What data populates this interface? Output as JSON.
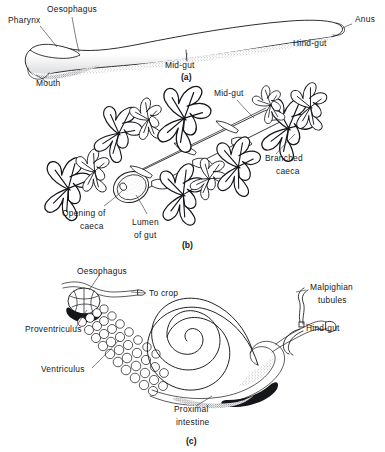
{
  "figure": {
    "background_color": "#ffffff",
    "ink_color": "#15161a",
    "panels": [
      {
        "id": "a",
        "caption": "(a)",
        "description": "Simple elongated straight gut tube, tapering, with stippled ventral shading",
        "labels": [
          {
            "name": "pharynx",
            "text": "Pharynx",
            "x": 8,
            "y": 23
          },
          {
            "name": "oesophagus",
            "text": "Oesophagus",
            "x": 47,
            "y": 12
          },
          {
            "name": "mouth",
            "text": "Mouth",
            "x": 36,
            "y": 86
          },
          {
            "name": "mid-gut",
            "text": "Mid-gut",
            "x": 165,
            "y": 65
          },
          {
            "name": "hind-gut",
            "text": "Hind-gut",
            "x": 293,
            "y": 44
          },
          {
            "name": "anus",
            "text": "Anus",
            "x": 355,
            "y": 22
          }
        ]
      },
      {
        "id": "b",
        "caption": "(b)",
        "description": "Cut-away mid-gut tube showing lumen and clusters of branched caeca opening into the gut",
        "labels": [
          {
            "name": "mid-gut",
            "text": "Mid-gut",
            "x": 214,
            "y": 96
          },
          {
            "name": "branched-caeca-line1",
            "text": "Branched",
            "x": 265,
            "y": 158
          },
          {
            "name": "branched-caeca-line2",
            "text": "caeca",
            "x": 274,
            "y": 171
          },
          {
            "name": "opening-of-caeca-line1",
            "text": "Opening of",
            "x": 62,
            "y": 213
          },
          {
            "name": "opening-of-caeca-line2",
            "text": "caeca",
            "x": 80,
            "y": 226
          },
          {
            "name": "lumen-of-gut-line1",
            "text": "Lumen",
            "x": 132,
            "y": 222
          },
          {
            "name": "lumen-of-gut-line2",
            "text": "of gut",
            "x": 134,
            "y": 235
          }
        ]
      },
      {
        "id": "c",
        "caption": "(c)",
        "description": "Insect gut with proventriculus, beaded ventriculus caeca rows, spiral proximal intestine, hind-gut and Malpighian tubules",
        "labels": [
          {
            "name": "oesophagus",
            "text": "Oesophagus",
            "x": 77,
            "y": 271
          },
          {
            "name": "to-crop",
            "text": "To crop",
            "x": 133,
            "y": 294
          },
          {
            "name": "proventriculus",
            "text": "Proventriculus",
            "x": 29,
            "y": 332
          },
          {
            "name": "ventriculus",
            "text": "Ventriculus",
            "x": 45,
            "y": 372
          },
          {
            "name": "proximal-intestine-line1",
            "text": "Proximal",
            "x": 174,
            "y": 409
          },
          {
            "name": "proximal-intestine-line2",
            "text": "intestine",
            "x": 176,
            "y": 422
          },
          {
            "name": "malpighian-tubules-line1",
            "text": "Malpighian",
            "x": 310,
            "y": 288
          },
          {
            "name": "malpighian-tubules-line2",
            "text": "tubules",
            "x": 318,
            "y": 301
          },
          {
            "name": "hind-gut",
            "text": "Hind-gut",
            "x": 308,
            "y": 328
          }
        ]
      }
    ],
    "captions": [
      {
        "name": "panel-a-caption",
        "text": "(a)",
        "x": 181,
        "y": 80
      },
      {
        "name": "panel-b-caption",
        "text": "(b)",
        "x": 182,
        "y": 248
      },
      {
        "name": "panel-c-caption",
        "text": "(c)",
        "x": 186,
        "y": 444
      }
    ]
  }
}
